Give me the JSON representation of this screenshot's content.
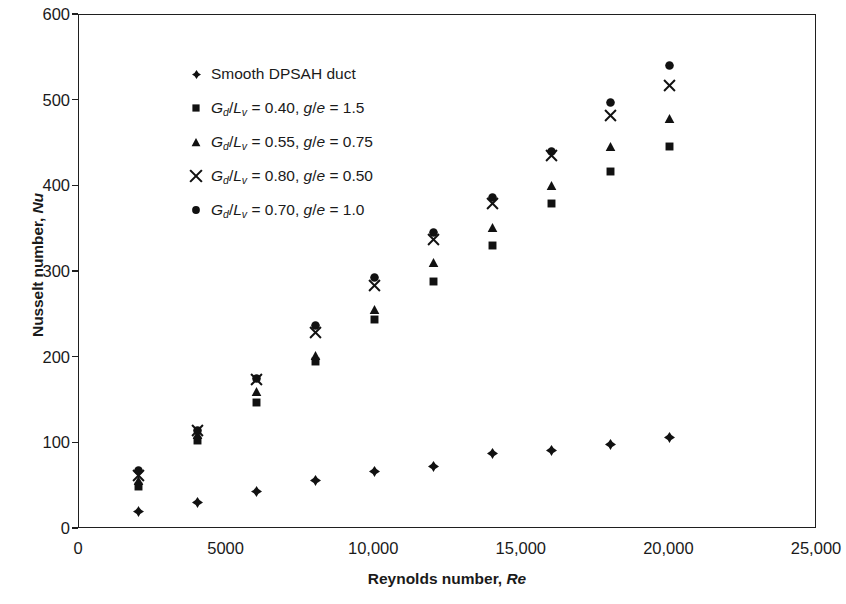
{
  "chart_data": {
    "type": "scatter",
    "title": "",
    "xlabel": "Reynolds number, Re",
    "ylabel": "Nusselt number, Nu",
    "xlim": [
      0,
      25000
    ],
    "ylim": [
      0,
      600
    ],
    "xticks": [
      0,
      5000,
      10000,
      15000,
      20000,
      25000
    ],
    "xticklabels": [
      "0",
      "5000",
      "10,000",
      "15,000",
      "20,000",
      "25,000"
    ],
    "yticks": [
      0,
      100,
      200,
      300,
      400,
      500,
      600
    ],
    "yticklabels": [
      "0",
      "100",
      "200",
      "300",
      "400",
      "500",
      "600"
    ],
    "grid": false,
    "legend_position": "upper left",
    "x": [
      2000,
      4000,
      6000,
      8000,
      10000,
      12000,
      14000,
      16000,
      18000,
      20000
    ],
    "series": [
      {
        "name": "Smooth DPSAH duct",
        "marker": "diamond",
        "values": [
          20,
          31,
          44,
          57,
          67,
          73,
          88,
          92,
          99,
          107
        ]
      },
      {
        "name": "Gd/Lv = 0.40, g/e = 1.5",
        "marker": "square",
        "values": [
          50,
          103,
          148,
          196,
          245,
          289,
          331,
          380,
          417,
          446
        ]
      },
      {
        "name": "Gd/Lv = 0.55, g/e = 0.75",
        "marker": "triangle",
        "values": [
          57,
          110,
          160,
          203,
          256,
          311,
          352,
          401,
          447,
          479
        ]
      },
      {
        "name": "Gd/Lv = 0.80, g/e = 0.50",
        "marker": "cross",
        "values": [
          63,
          115,
          174,
          229,
          284,
          338,
          380,
          436,
          483,
          518
        ]
      },
      {
        "name": "Gd/Lv = 0.70, g/e = 1.0",
        "marker": "circle",
        "values": [
          68,
          115,
          176,
          238,
          293,
          346,
          387,
          441,
          498,
          541
        ]
      }
    ]
  },
  "axes": {
    "ylabel_main": "Nusselt number, ",
    "ylabel_italic": "Nu",
    "xlabel_main": "Reynolds number, ",
    "xlabel_italic": "Re"
  },
  "legend": {
    "items": [
      {
        "marker": "diamond",
        "label_plain": "Smooth DPSAH duct",
        "is_formula": false
      },
      {
        "marker": "square",
        "is_formula": true,
        "num": "G",
        "num_sub": "d",
        "den": "L",
        "den_sub": "v",
        "ratio_value": "0.40",
        "ge_value": "1.5",
        "label_plain": "Gd/Lv = 0.40, g/e = 1.5"
      },
      {
        "marker": "triangle",
        "is_formula": true,
        "num": "G",
        "num_sub": "d",
        "den": "L",
        "den_sub": "v",
        "ratio_value": "0.55",
        "ge_value": "0.75",
        "label_plain": "Gd/Lv = 0.55, g/e = 0.75"
      },
      {
        "marker": "cross",
        "is_formula": true,
        "num": "G",
        "num_sub": "d",
        "den": "L",
        "den_sub": "v",
        "ratio_value": "0.80",
        "ge_value": "0.50",
        "label_plain": "Gd/Lv = 0.80, g/e = 0.50"
      },
      {
        "marker": "circle",
        "is_formula": true,
        "num": "G",
        "num_sub": "d",
        "den": "L",
        "den_sub": "v",
        "ratio_value": "0.70",
        "ge_value": "1.0",
        "label_plain": "Gd/Lv = 0.70, g/e = 1.0"
      }
    ]
  },
  "style": {
    "marker_color": "#111111",
    "axis_color": "#1f1f1f",
    "background": "#ffffff"
  }
}
